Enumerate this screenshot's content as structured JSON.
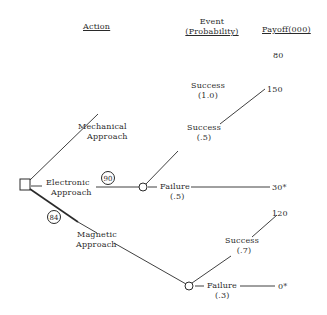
{
  "headers": {
    "action": "Action",
    "event_line1": "Event",
    "event_line2": "(Probability)",
    "payoff": "Payoff(000)"
  },
  "decision_node": {
    "shape": "square"
  },
  "actions": [
    {
      "line1": "Mechanical",
      "line2": "Approach",
      "payoff": "80"
    },
    {
      "line1": "Electronic",
      "line2": "Approach",
      "expected_value": "90"
    },
    {
      "line1": "Magnetic",
      "line2": "Approach",
      "expected_value": "84"
    }
  ],
  "electronic_events": [
    {
      "event": "Success",
      "probability": "(.5)",
      "payoff": "150"
    },
    {
      "event": "Failure",
      "probability": "(.5)",
      "payoff": "30*"
    }
  ],
  "magnetic_events": [
    {
      "event": "Success",
      "probability": "(.7)",
      "payoff": "120"
    },
    {
      "event": "Failure",
      "probability": "(.3)",
      "payoff": "0*"
    }
  ],
  "mechanical_event": {
    "event": "Success",
    "probability": "(1.0)"
  },
  "colors": {
    "ink": "#2a2a2a",
    "background": "#ffffff"
  }
}
